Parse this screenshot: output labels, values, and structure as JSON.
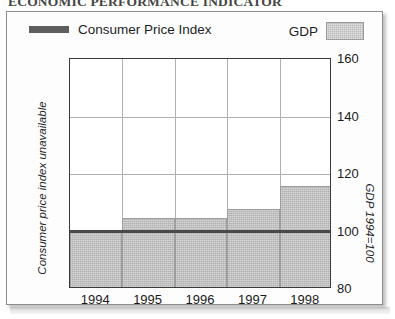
{
  "document": {
    "title": "ECONOMIC PERFORMANCE INDICATOR"
  },
  "legend": {
    "position": "top",
    "entries": [
      {
        "label": "Consumer Price Index",
        "swatch": "line",
        "color": "#5e5e5e"
      },
      {
        "label": "GDP",
        "swatch": "filled-box",
        "color": "#b9b9b9"
      }
    ]
  },
  "axes": {
    "left_title": "Consumer price index unavailable",
    "right_title": "GDP 1994=100",
    "y_ticks": [
      "160",
      "140",
      "120",
      "100",
      "80"
    ],
    "x_ticks": [
      "1994",
      "1995",
      "1996",
      "1997",
      "1998"
    ]
  },
  "colors": {
    "bar_fill": "#b0b0b0",
    "bar_stroke": "#9d9d9d",
    "cpi_line": "#4a4a4a",
    "grid": "#b0b0b0",
    "frame": "#3a3a3a",
    "page_border": "#8c8c8c"
  },
  "chart_data": {
    "type": "bar",
    "title": "ECONOMIC PERFORMANCE INDICATOR",
    "xlabel": "",
    "ylabel": "GDP 1994=100",
    "ylim": [
      80,
      160
    ],
    "yticks": [
      80,
      100,
      120,
      140,
      160
    ],
    "grid": true,
    "legend_position": "top",
    "categories": [
      "1994",
      "1995",
      "1996",
      "1997",
      "1998"
    ],
    "series": [
      {
        "name": "GDP",
        "type": "bar",
        "values": [
          100,
          104,
          104,
          107,
          115
        ]
      },
      {
        "name": "Consumer Price Index",
        "type": "line",
        "values": [
          100,
          100,
          100,
          100,
          100
        ],
        "note": "Consumer price index unavailable"
      }
    ],
    "annotations": [
      "Consumer price index unavailable"
    ]
  }
}
